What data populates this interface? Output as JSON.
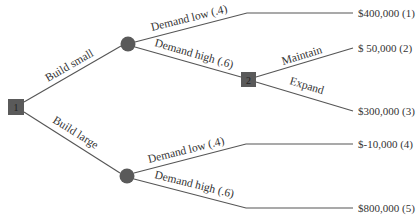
{
  "diagram": {
    "type": "decision-tree",
    "colors": {
      "line": "#555555",
      "node_fill": "#5a5a5a",
      "text": "#333333"
    },
    "decision_nodes": [
      {
        "id": "1",
        "label": "1"
      },
      {
        "id": "2",
        "label": "2"
      }
    ],
    "branches": {
      "build_small": "Build small",
      "build_large": "Build large",
      "small_demand_low": "Demand low (.4)",
      "small_demand_high": "Demand high (.6)",
      "maintain": "Maintain",
      "expand": "Expand",
      "large_demand_low": "Demand low (.4)",
      "large_demand_high": "Demand high (.6)"
    },
    "payoffs": [
      {
        "value": "$400,000",
        "index": "(1)",
        "text": "$400,000 (1)"
      },
      {
        "value": "$ 50,000",
        "index": "(2)",
        "text": "$ 50,000 (2)"
      },
      {
        "value": "$300,000",
        "index": "(3)",
        "text": "$300,000 (3)"
      },
      {
        "value": "$-10,000",
        "index": "(4)",
        "text": "$-10,000 (4)"
      },
      {
        "value": "$800,000",
        "index": "(5)",
        "text": "$800,000 (5)"
      }
    ]
  }
}
